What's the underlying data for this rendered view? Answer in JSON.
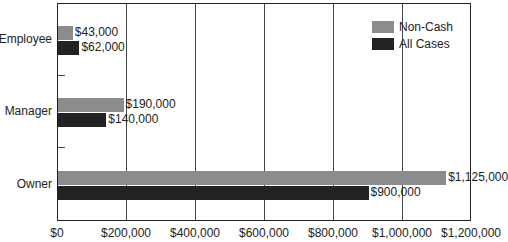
{
  "chart_data": {
    "type": "bar",
    "orientation": "horizontal",
    "categories": [
      "Employee",
      "Manager",
      "Owner"
    ],
    "series": [
      {
        "name": "Non-Cash",
        "color": "#8c8c8c",
        "values": [
          43000,
          190000,
          1125000
        ],
        "labels": [
          "$43,000",
          "$190,000",
          "$1,125,000"
        ]
      },
      {
        "name": "All Cases",
        "color": "#222222",
        "values": [
          62000,
          140000,
          900000
        ],
        "labels": [
          "$62,000",
          "$140,000",
          "$900,000"
        ]
      }
    ],
    "title": "",
    "xlabel": "",
    "ylabel": "",
    "xlim": [
      0,
      1200000
    ],
    "xticks": [
      "$0",
      "$200,000",
      "$400,000",
      "$600,000",
      "$800,000",
      "$1,000,000",
      "$1,200,000"
    ],
    "grid": "vertical",
    "legend_position": "top-right"
  }
}
